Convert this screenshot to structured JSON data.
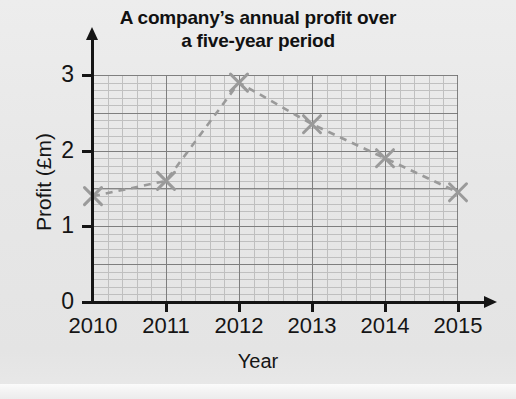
{
  "chart_data": {
    "type": "line",
    "title_line1": "A company’s annual profit over",
    "title_line2": "a five-year period",
    "xlabel": "Year",
    "ylabel": "Profit (£m)",
    "categories": [
      "2010",
      "2011",
      "2012",
      "2013",
      "2014",
      "2015"
    ],
    "values": [
      1.4,
      1.6,
      2.9,
      2.35,
      1.9,
      1.45
    ],
    "x": [
      2010,
      2011,
      2012,
      2013,
      2014,
      2015
    ],
    "xlim": [
      2010,
      2015
    ],
    "ylim": [
      0,
      3
    ],
    "y_ticks": [
      "0",
      "1",
      "2",
      "3"
    ],
    "y_tick_values": [
      0,
      1,
      2,
      3
    ],
    "x_ticks": [
      "2010",
      "2011",
      "2012",
      "2013",
      "2014",
      "2015"
    ],
    "grid": true,
    "grid_major_x_step": 1,
    "grid_major_y_step": 0.5,
    "grid_minor_x_step": 0.2,
    "grid_minor_y_step": 0.1,
    "legend": null,
    "legend_position": "none",
    "marker": "x-cross",
    "line_style": "dashed",
    "series_color": "#9a9a9a",
    "axis_color": "#151515",
    "grid_color": "#6f6f6f",
    "grid_minor_color": "#b9b9b9",
    "background_color": "#e9e9e9"
  }
}
